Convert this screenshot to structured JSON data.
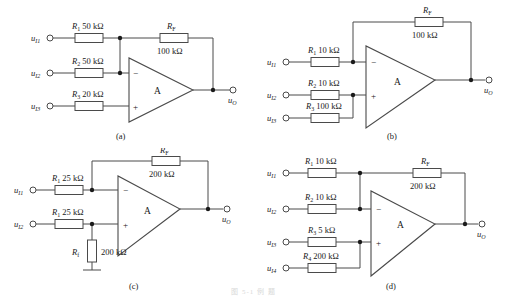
{
  "figure": {
    "caption_bottom": "图 5-1 例 题",
    "subfigures": [
      {
        "id": "a",
        "caption": "(a)",
        "amp_label": "A",
        "output_label": "u",
        "output_sub": "O",
        "inputs": [
          {
            "label": "u",
            "sub": "I1"
          },
          {
            "label": "u",
            "sub": "I2"
          },
          {
            "label": "u",
            "sub": "I3"
          }
        ],
        "resistors": [
          {
            "name": "R",
            "sub": "1",
            "value": "50 kΩ"
          },
          {
            "name": "R",
            "sub": "2",
            "value": "50 kΩ"
          },
          {
            "name": "R",
            "sub": "3",
            "value": "20 kΩ"
          }
        ],
        "feedback": {
          "name": "R",
          "sub": "F",
          "value": "100 kΩ"
        },
        "terminal_plus": "+",
        "terminal_minus": "−"
      },
      {
        "id": "b",
        "caption": "(b)",
        "amp_label": "A",
        "output_label": "u",
        "output_sub": "O",
        "inputs": [
          {
            "label": "u",
            "sub": "I1"
          },
          {
            "label": "u",
            "sub": "I2"
          },
          {
            "label": "u",
            "sub": "I3"
          }
        ],
        "resistors": [
          {
            "name": "R",
            "sub": "1",
            "value": "10 kΩ"
          },
          {
            "name": "R",
            "sub": "2",
            "value": "10 kΩ"
          },
          {
            "name": "R",
            "sub": "3",
            "value": "100 kΩ"
          }
        ],
        "feedback": {
          "name": "R",
          "sub": "F",
          "value": "100 kΩ"
        },
        "terminal_plus": "+",
        "terminal_minus": "−"
      },
      {
        "id": "c",
        "caption": "(c)",
        "amp_label": "A",
        "output_label": "u",
        "output_sub": "O",
        "inputs": [
          {
            "label": "u",
            "sub": "I1"
          },
          {
            "label": "u",
            "sub": "I2"
          }
        ],
        "resistors": [
          {
            "name": "R",
            "sub": "1",
            "value": "25 kΩ"
          },
          {
            "name": "R",
            "sub": "1",
            "value": "25 kΩ"
          }
        ],
        "shunt": {
          "name": "R",
          "sub": "f",
          "value": "200 kΩ"
        },
        "feedback": {
          "name": "R",
          "sub": "F",
          "value": "200 kΩ"
        },
        "terminal_plus": "+",
        "terminal_minus": "−"
      },
      {
        "id": "d",
        "caption": "(d)",
        "amp_label": "A",
        "output_label": "u",
        "output_sub": "O",
        "inputs": [
          {
            "label": "u",
            "sub": "I1"
          },
          {
            "label": "u",
            "sub": "I2"
          },
          {
            "label": "u",
            "sub": "I3"
          },
          {
            "label": "u",
            "sub": "I4"
          }
        ],
        "resistors": [
          {
            "name": "R",
            "sub": "1",
            "value": "10 kΩ"
          },
          {
            "name": "R",
            "sub": "2",
            "value": "10 kΩ"
          },
          {
            "name": "R",
            "sub": "3",
            "value": "5 kΩ"
          },
          {
            "name": "R",
            "sub": "4",
            "value": "200 kΩ"
          }
        ],
        "feedback": {
          "name": "R",
          "sub": "F",
          "value": "200 kΩ"
        },
        "terminal_plus": "+",
        "terminal_minus": "−"
      }
    ]
  },
  "colors": {
    "wire": "#4a4a4a",
    "text": "#1a1a1a",
    "background": "#ffffff"
  }
}
